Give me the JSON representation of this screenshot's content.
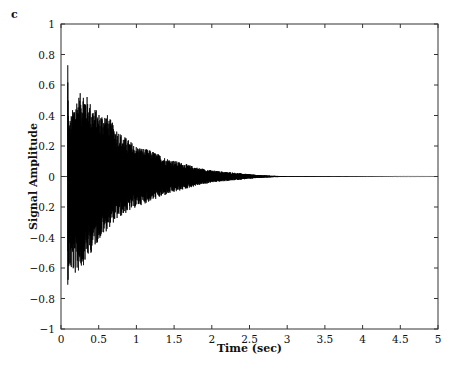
{
  "panel_label": "c",
  "chart_data": {
    "type": "line",
    "title": "",
    "xlabel": "Time (sec)",
    "ylabel": "Signal Amplitude",
    "xlim": [
      0,
      5
    ],
    "ylim": [
      -1,
      1
    ],
    "xticks": [
      0,
      0.5,
      1,
      1.5,
      2,
      2.5,
      3,
      3.5,
      4,
      4.5,
      5
    ],
    "xtick_labels": [
      "0",
      "0.5",
      "1",
      "1.5",
      "2",
      "2.5",
      "3",
      "3.5",
      "4",
      "4.5",
      "5"
    ],
    "yticks": [
      -1,
      -0.8,
      -0.6,
      -0.4,
      -0.2,
      0,
      0.2,
      0.4,
      0.6,
      0.8,
      1
    ],
    "ytick_labels": [
      "−1",
      "−0.8",
      "−0.6",
      "−0.4",
      "−0.2",
      "0",
      "0.2",
      "0.4",
      "0.6",
      "0.8",
      "1"
    ],
    "grid": false,
    "legend": null,
    "series": [
      {
        "name": "signal",
        "color": "#000000",
        "description": "Decaying oscillatory signal (impulse response) starting at ~0.09 s, peak +0.73 / -0.71, decays to ~0 by ~2.8 s",
        "onset_time": 0.09,
        "envelope_upper": {
          "t": [
            0.09,
            0.1,
            0.2,
            0.3,
            0.4,
            0.5,
            0.6,
            0.7,
            0.8,
            1.0,
            1.2,
            1.4,
            1.6,
            1.8,
            2.0,
            2.2,
            2.4,
            2.6,
            2.8,
            3.0,
            5.0
          ],
          "a": [
            0.73,
            0.35,
            0.52,
            0.57,
            0.48,
            0.42,
            0.42,
            0.34,
            0.28,
            0.2,
            0.17,
            0.12,
            0.09,
            0.06,
            0.04,
            0.03,
            0.02,
            0.01,
            0.005,
            0.002,
            0.0
          ]
        },
        "envelope_lower": {
          "t": [
            0.09,
            0.1,
            0.2,
            0.3,
            0.4,
            0.5,
            0.6,
            0.7,
            0.8,
            1.0,
            1.2,
            1.4,
            1.6,
            1.8,
            2.0,
            2.2,
            2.4,
            2.6,
            2.8,
            3.0,
            5.0
          ],
          "a": [
            -0.71,
            -0.62,
            -0.65,
            -0.58,
            -0.5,
            -0.42,
            -0.36,
            -0.3,
            -0.26,
            -0.2,
            -0.16,
            -0.12,
            -0.09,
            -0.06,
            -0.04,
            -0.03,
            -0.02,
            -0.01,
            -0.005,
            -0.002,
            0.0
          ]
        }
      }
    ]
  }
}
